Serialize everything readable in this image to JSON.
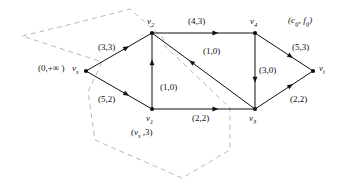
{
  "figure": {
    "type": "network-flow-graph",
    "legend": {
      "text": "(cᵢⱼ, fᵢⱼ)",
      "c_symbol": "c",
      "f_symbol": "f",
      "subscript": "ij",
      "x": 288,
      "y": 16
    },
    "colors": {
      "edge": "#111111",
      "node": "#111111",
      "cut": "#b9b9b9",
      "background": "#ffffff",
      "text": "#111111"
    },
    "nodes": [
      {
        "id": "vs",
        "label": "v",
        "sub": "s",
        "x": 86,
        "y": 71,
        "label_x": 72,
        "label_y": 64
      },
      {
        "id": "v2",
        "label": "v",
        "sub": "2",
        "x": 152,
        "y": 33,
        "label_x": 147,
        "label_y": 17
      },
      {
        "id": "v4",
        "label": "v",
        "sub": "4",
        "x": 255,
        "y": 33,
        "label_x": 250,
        "label_y": 17
      },
      {
        "id": "v1",
        "label": "v",
        "sub": "1",
        "x": 152,
        "y": 109,
        "label_x": 146,
        "label_y": 114
      },
      {
        "id": "v3",
        "label": "v",
        "sub": "3",
        "x": 255,
        "y": 109,
        "label_x": 249,
        "label_y": 114
      },
      {
        "id": "vt",
        "label": "v",
        "sub": "t",
        "x": 313,
        "y": 71,
        "label_x": 319,
        "label_y": 64
      }
    ],
    "edges": [
      {
        "id": "vs-v2",
        "from": "vs",
        "to": "v2",
        "capacity": 3,
        "flow": 3,
        "label": "(3,3)",
        "label_x": 98,
        "label_y": 43
      },
      {
        "id": "vs-v1",
        "from": "vs",
        "to": "v1",
        "capacity": 5,
        "flow": 2,
        "label": "(5,2)",
        "label_x": 98,
        "label_y": 95
      },
      {
        "id": "v2-v4",
        "from": "v2",
        "to": "v4",
        "capacity": 4,
        "flow": 3,
        "label": "(4,3)",
        "label_x": 188,
        "label_y": 17
      },
      {
        "id": "v1-v2",
        "from": "v1",
        "to": "v2",
        "capacity": 1,
        "flow": 0,
        "label": "(1,0)",
        "label_x": 160,
        "label_y": 83
      },
      {
        "id": "v3-v2",
        "from": "v3",
        "to": "v2",
        "capacity": 1,
        "flow": 0,
        "label": "(1,0)",
        "label_x": 203,
        "label_y": 47
      },
      {
        "id": "v1-v3",
        "from": "v1",
        "to": "v3",
        "capacity": 2,
        "flow": 2,
        "label": "(2,2)",
        "label_x": 192,
        "label_y": 114
      },
      {
        "id": "v4-v3",
        "from": "v4",
        "to": "v3",
        "capacity": 3,
        "flow": 0,
        "label": "(3,0)",
        "label_x": 259,
        "label_y": 66
      },
      {
        "id": "v4-vt",
        "from": "v4",
        "to": "vt",
        "capacity": 5,
        "flow": 3,
        "label": "(5,3)",
        "label_x": 292,
        "label_y": 43
      },
      {
        "id": "v3-vt",
        "from": "v3",
        "to": "vt",
        "capacity": 2,
        "flow": 2,
        "label": "(2,2)",
        "label_x": 290,
        "label_y": 95
      }
    ],
    "annotations": [
      {
        "id": "source-potential",
        "text": "(0,+∞ )",
        "x": 38,
        "y": 64
      },
      {
        "id": "v1-mark",
        "text": "(v",
        "sub": "s",
        "text2": " ,3)",
        "x": 131,
        "y": 128
      }
    ],
    "cut_polygon": {
      "points": "22,36 72,24 130,9 163,38 165,46 230,108 230,150 182,178 95,140 88,92 102,62 22,36",
      "stroke": "#b9b9b9",
      "dash": "5,4"
    }
  }
}
